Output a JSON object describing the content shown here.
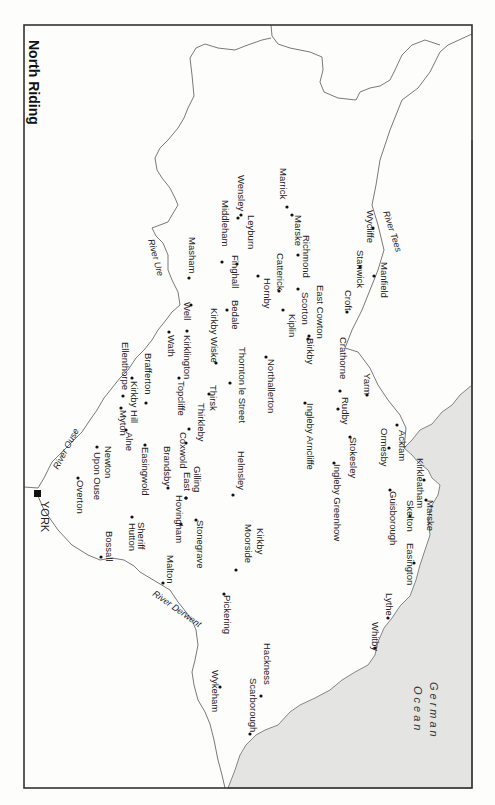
{
  "title": "North Riding",
  "sea": {
    "name_line1": "German",
    "name_line2": "Ocean"
  },
  "rivers": [
    {
      "name": "River Tees",
      "x": 383,
      "y": 212,
      "rot": 72
    },
    {
      "name": "River Ure",
      "x": 148,
      "y": 240,
      "rot": 75
    },
    {
      "name": "River Ouse",
      "x": 58,
      "y": 470,
      "rot": -62
    },
    {
      "name": "River Derwent",
      "x": 152,
      "y": 595,
      "rot": 35
    }
  ],
  "york": {
    "name": "YORK",
    "x": 39,
    "y": 494
  },
  "places": [
    {
      "name": "Marske",
      "x": 295,
      "y": 215,
      "dot": [
        292,
        215
      ]
    },
    {
      "name": "Marrick",
      "x": 280,
      "y": 168,
      "dot": [
        287,
        207
      ]
    },
    {
      "name": "Wensley",
      "x": 238,
      "y": 175,
      "dot": [
        238,
        218
      ]
    },
    {
      "name": "Leyburn",
      "x": 248,
      "y": 215,
      "dot": [
        241,
        215
      ]
    },
    {
      "name": "Middleham",
      "x": 222,
      "y": 200,
      "dot": [
        222,
        262
      ]
    },
    {
      "name": "Wycliffe",
      "x": 367,
      "y": 210,
      "dot": [
        373,
        228
      ]
    },
    {
      "name": "Stanwick",
      "x": 357,
      "y": 250,
      "dot": [
        360,
        267
      ]
    },
    {
      "name": "Manfield",
      "x": 381,
      "y": 262,
      "dot": [
        374,
        276
      ]
    },
    {
      "name": "Richmond",
      "x": 303,
      "y": 235,
      "dot": [
        298,
        255
      ]
    },
    {
      "name": "Catterick",
      "x": 277,
      "y": 253,
      "dot": [
        279,
        291
      ]
    },
    {
      "name": "Finghall",
      "x": 232,
      "y": 255,
      "dot": [
        237,
        264
      ]
    },
    {
      "name": "Hornby",
      "x": 264,
      "y": 278,
      "dot": [
        258,
        276
      ]
    },
    {
      "name": "Masham",
      "x": 189,
      "y": 237,
      "dot": [
        189,
        278
      ]
    },
    {
      "name": "East Cowton",
      "x": 317,
      "y": 285,
      "dot": [
        309,
        336
      ]
    },
    {
      "name": "Scorton",
      "x": 302,
      "y": 292,
      "dot": [
        298,
        289
      ]
    },
    {
      "name": "Kiplin",
      "x": 289,
      "y": 314,
      "dot": [
        283,
        310
      ]
    },
    {
      "name": "Birkby",
      "x": 307,
      "y": 338,
      "dot": [
        308,
        339
      ]
    },
    {
      "name": "Croft",
      "x": 345,
      "y": 290,
      "dot": [
        347,
        312
      ]
    },
    {
      "name": "Bedale",
      "x": 232,
      "y": 300,
      "dot": [
        227,
        310
      ]
    },
    {
      "name": "Well",
      "x": 184,
      "y": 302,
      "dot": [
        191,
        305
      ]
    },
    {
      "name": "Kirkby Wiske",
      "x": 211,
      "y": 308,
      "dot": [
        216,
        363
      ]
    },
    {
      "name": "Kirklington",
      "x": 184,
      "y": 335,
      "dot": [
        187,
        331
      ]
    },
    {
      "name": "Wath",
      "x": 168,
      "y": 335,
      "dot": [
        169,
        332
      ]
    },
    {
      "name": "Thornton le Street",
      "x": 239,
      "y": 347,
      "dot": [
        230,
        383
      ]
    },
    {
      "name": "Northallerton",
      "x": 268,
      "y": 359,
      "dot": [
        266,
        357
      ]
    },
    {
      "name": "Thirsk",
      "x": 210,
      "y": 385,
      "dot": [
        209,
        394
      ]
    },
    {
      "name": "Topcliffe",
      "x": 178,
      "y": 381,
      "dot": [
        179,
        378
      ]
    },
    {
      "name": "Brafferton",
      "x": 145,
      "y": 353,
      "dot": [
        146,
        403
      ]
    },
    {
      "name": "Kirkby Hill",
      "x": 131,
      "y": 381,
      "dot": [
        132,
        378
      ]
    },
    {
      "name": "Ellenthorpe",
      "x": 122,
      "y": 342,
      "dot": [
        123,
        396
      ]
    },
    {
      "name": "Myton",
      "x": 120,
      "y": 410,
      "dot": [
        121,
        408
      ]
    },
    {
      "name": "Alne",
      "x": 126,
      "y": 432,
      "dot": [
        126,
        430
      ]
    },
    {
      "name": "Crathorne",
      "x": 340,
      "y": 337,
      "dot": [
        340,
        391
      ]
    },
    {
      "name": "Rudby",
      "x": 342,
      "y": 397,
      "dot": [
        338,
        409
      ]
    },
    {
      "name": "Yarm",
      "x": 364,
      "y": 373,
      "dot": [
        367,
        395
      ]
    },
    {
      "name": "Ingleby Arncliffe",
      "x": 307,
      "y": 403,
      "dot": [
        305,
        403
      ]
    },
    {
      "name": "Acklam",
      "x": 399,
      "y": 430,
      "dot": [
        397,
        425
      ]
    },
    {
      "name": "Ormesby",
      "x": 381,
      "y": 428,
      "dot": [
        389,
        448
      ]
    },
    {
      "name": "Stokesley",
      "x": 350,
      "y": 437,
      "dot": [
        350,
        437
      ]
    },
    {
      "name": "Ingleby Greenhow",
      "x": 334,
      "y": 464,
      "dot": [
        334,
        463
      ]
    },
    {
      "name": "Kirkleatham",
      "x": 417,
      "y": 458,
      "dot": [
        424,
        480
      ]
    },
    {
      "name": "Marske",
      "x": 427,
      "y": 500,
      "dot": [
        426,
        500
      ]
    },
    {
      "name": "Skelton",
      "x": 407,
      "y": 500,
      "dot": [
        410,
        516
      ]
    },
    {
      "name": "Guisborough",
      "x": 390,
      "y": 491,
      "dot": [
        390,
        490
      ]
    },
    {
      "name": "Easington",
      "x": 407,
      "y": 543,
      "dot": [
        414,
        563
      ]
    },
    {
      "name": "Thirkleby",
      "x": 198,
      "y": 403,
      "dot": [
        189,
        429
      ]
    },
    {
      "name": "Coxwold",
      "x": 180,
      "y": 432,
      "dot": [
        186,
        443
      ]
    },
    {
      "name": "Helmsley",
      "x": 238,
      "y": 451,
      "dot": [
        233,
        495
      ]
    },
    {
      "name": "Brandsby",
      "x": 164,
      "y": 446,
      "dot": [
        168,
        488
      ]
    },
    {
      "name": "Gilling",
      "x": 194,
      "y": 466,
      "dot": [
        186,
        498
      ]
    },
    {
      "name": "East",
      "x": 184,
      "y": 472,
      "dot": [
        186,
        498
      ]
    },
    {
      "name": "Easingwold",
      "x": 142,
      "y": 447,
      "dot": [
        145,
        445
      ]
    },
    {
      "name": "Newton",
      "x": 105,
      "y": 446
    },
    {
      "name": "Upon Ouse",
      "x": 94,
      "y": 452,
      "dot": [
        97,
        447
      ]
    },
    {
      "name": "Overton",
      "x": 77,
      "y": 480,
      "dot": [
        78,
        478
      ]
    },
    {
      "name": "Hovingham",
      "x": 176,
      "y": 495,
      "dot": [
        181,
        524
      ]
    },
    {
      "name": "Stonegrave",
      "x": 197,
      "y": 520,
      "dot": [
        196,
        520
      ]
    },
    {
      "name": "Kirkby",
      "x": 257,
      "y": 528
    },
    {
      "name": "Moorside",
      "x": 245,
      "y": 524,
      "dot": [
        236,
        570
      ]
    },
    {
      "name": "Sheriff",
      "x": 138,
      "y": 522
    },
    {
      "name": "Hutton",
      "x": 129,
      "y": 523,
      "dot": [
        132,
        517
      ]
    },
    {
      "name": "Bossall",
      "x": 106,
      "y": 531,
      "dot": [
        101,
        557
      ]
    },
    {
      "name": "Malton",
      "x": 167,
      "y": 555,
      "dot": [
        163,
        583
      ]
    },
    {
      "name": "Pickering",
      "x": 224,
      "y": 595,
      "dot": [
        224,
        594
      ]
    },
    {
      "name": "Hackness",
      "x": 264,
      "y": 643,
      "dot": [
        261,
        696
      ]
    },
    {
      "name": "Wykeham",
      "x": 212,
      "y": 670,
      "dot": [
        220,
        687
      ]
    },
    {
      "name": "Scarborough",
      "x": 250,
      "y": 678,
      "dot": [
        250,
        734
      ]
    },
    {
      "name": "Lythe",
      "x": 386,
      "y": 593,
      "dot": [
        388,
        618
      ]
    },
    {
      "name": "Whitby",
      "x": 372,
      "y": 622,
      "dot": [
        375,
        648
      ]
    }
  ]
}
